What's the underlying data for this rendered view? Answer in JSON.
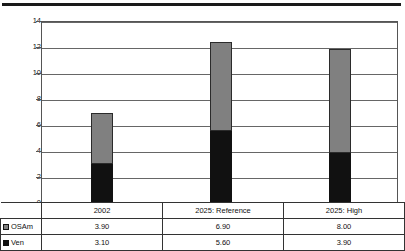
{
  "header": {
    "clipped_title": ""
  },
  "chart_data": {
    "type": "bar",
    "subtype": "stacked-bar",
    "title": "",
    "xlabel": "",
    "ylabel": "",
    "ylim": [
      0,
      14
    ],
    "yticks": [
      0,
      2,
      4,
      6,
      8,
      10,
      12,
      14
    ],
    "ytick_labels": [
      "0",
      "2",
      "4",
      "6",
      "8",
      "10",
      "12",
      "14"
    ],
    "grid": true,
    "legend_position": "table-below",
    "categories": [
      "2002",
      "2025: Reference",
      "2025: High"
    ],
    "series": [
      {
        "name": "OSAm",
        "color": "#808080",
        "swatch": "gray",
        "values": [
          3.9,
          6.9,
          8.0
        ],
        "labels": [
          "3.90",
          "6.90",
          "8.00"
        ]
      },
      {
        "name": "Ven",
        "color": "#111111",
        "swatch": "black",
        "values": [
          3.1,
          5.6,
          3.9
        ],
        "labels": [
          "3.10",
          "5.60",
          "3.90"
        ]
      }
    ],
    "totals": [
      7.0,
      12.5,
      11.9
    ]
  },
  "table": {
    "corner_blank": "",
    "category_header": [
      "2002",
      "2025: Reference",
      "2025: High"
    ],
    "rows": [
      {
        "legend": "OSAm",
        "swatch": "gray",
        "cells": [
          "3.90",
          "6.90",
          "8.00"
        ]
      },
      {
        "legend": "Ven",
        "swatch": "black",
        "cells": [
          "3.10",
          "5.60",
          "3.90"
        ]
      }
    ]
  }
}
